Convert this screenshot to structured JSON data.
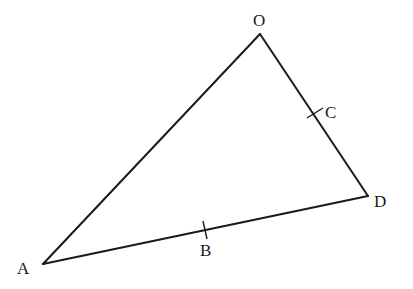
{
  "diagram": {
    "type": "triangle",
    "points": {
      "O": {
        "label": "O",
        "x": 260,
        "y": 34,
        "label_x": 253,
        "label_y": 26
      },
      "A": {
        "label": "A",
        "x": 43,
        "y": 264,
        "label_x": 17,
        "label_y": 274
      },
      "D": {
        "label": "D",
        "x": 368,
        "y": 196,
        "label_x": 374,
        "label_y": 207
      },
      "B": {
        "label": "B",
        "x": 205,
        "y": 230,
        "label_x": 200,
        "label_y": 256,
        "on_side": "AD"
      },
      "C": {
        "label": "C",
        "x": 315,
        "y": 113,
        "label_x": 325,
        "label_y": 118,
        "on_side": "OD"
      }
    },
    "sides": [
      {
        "from": "O",
        "to": "A"
      },
      {
        "from": "O",
        "to": "D"
      },
      {
        "from": "A",
        "to": "D"
      }
    ],
    "labels": {
      "O": "O",
      "A": "A",
      "D": "D",
      "B": "B",
      "C": "C"
    },
    "colors": {
      "line": "#1a1a1a",
      "background": "#ffffff"
    }
  }
}
